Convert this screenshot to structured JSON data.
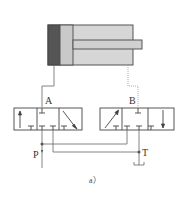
{
  "diagram": {
    "type": "hydraulic-circuit",
    "cylinder": {
      "body_color": "#d6d6d6",
      "cap_color": "#555555",
      "piston_color": "#c9c9c9",
      "rod_color": "#d0d0d0",
      "stroke_color": "#555555"
    },
    "valves": [
      {
        "id": "left-valve",
        "positions": 3,
        "port_label": "A"
      },
      {
        "id": "right-valve",
        "positions": 3,
        "port_label": "B"
      }
    ],
    "ports": {
      "a": "A",
      "b": "B",
      "p": "P",
      "t": "T"
    },
    "caption": "a）",
    "line_color": "#555555"
  }
}
